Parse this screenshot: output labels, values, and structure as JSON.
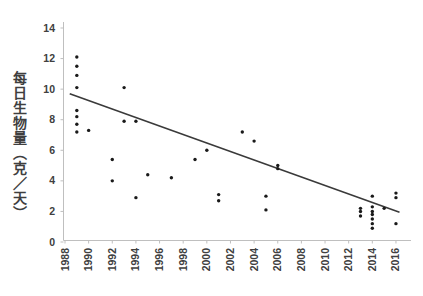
{
  "chart_data": {
    "type": "scatter",
    "title": "",
    "xlabel": "",
    "ylabel": "每日生物量（克／天）",
    "legend": "none",
    "grid": false,
    "ylim": [
      0,
      14
    ],
    "xlim": [
      1988,
      2017
    ],
    "y_ticks": [
      0,
      2,
      4,
      6,
      8,
      10,
      12,
      14
    ],
    "x_ticks": [
      1988,
      1990,
      1992,
      1994,
      1996,
      1998,
      2000,
      2002,
      2004,
      2006,
      2008,
      2010,
      2012,
      2014,
      2016
    ],
    "points": [
      [
        1989,
        12.1
      ],
      [
        1989,
        11.5
      ],
      [
        1989,
        10.9
      ],
      [
        1989,
        10.1
      ],
      [
        1989,
        8.6
      ],
      [
        1989,
        8.2
      ],
      [
        1989,
        7.7
      ],
      [
        1989,
        7.2
      ],
      [
        1990,
        7.3
      ],
      [
        1992,
        5.4
      ],
      [
        1992,
        4.0
      ],
      [
        1993,
        10.1
      ],
      [
        1993,
        7.9
      ],
      [
        1994,
        7.9
      ],
      [
        1994,
        2.9
      ],
      [
        1995,
        4.4
      ],
      [
        1997,
        4.2
      ],
      [
        1999,
        5.4
      ],
      [
        2000,
        6.0
      ],
      [
        2001,
        3.1
      ],
      [
        2001,
        2.7
      ],
      [
        2003,
        7.2
      ],
      [
        2004,
        6.6
      ],
      [
        2005,
        3.0
      ],
      [
        2005,
        2.1
      ],
      [
        2006,
        5.0
      ],
      [
        2006,
        4.8
      ],
      [
        2013,
        2.2
      ],
      [
        2013,
        2.0
      ],
      [
        2013,
        1.7
      ],
      [
        2014,
        3.0
      ],
      [
        2014,
        2.3
      ],
      [
        2014,
        2.0
      ],
      [
        2014,
        1.8
      ],
      [
        2014,
        1.5
      ],
      [
        2014,
        1.2
      ],
      [
        2014,
        0.9
      ],
      [
        2015,
        2.2
      ],
      [
        2016,
        3.2
      ],
      [
        2016,
        2.9
      ],
      [
        2016,
        1.2
      ]
    ],
    "trendline": {
      "x1": 1988.4,
      "y1": 9.7,
      "x2": 2016.3,
      "y2": 1.95
    },
    "colors": {
      "point": "#1a1a1a",
      "trend": "#3a3a3a",
      "axis": "#bfbfbf",
      "tick_label": "#404040"
    }
  }
}
